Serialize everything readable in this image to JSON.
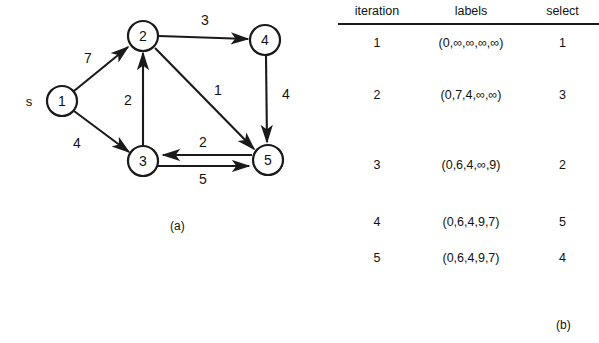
{
  "figure_a": {
    "caption": "(a)",
    "source_tag": "s",
    "nodes": [
      {
        "id": "1",
        "label": "1",
        "cx": 62,
        "cy": 101
      },
      {
        "id": "2",
        "label": "2",
        "cx": 143,
        "cy": 36
      },
      {
        "id": "3",
        "label": "3",
        "cx": 143,
        "cy": 161
      },
      {
        "id": "4",
        "label": "4",
        "cx": 265,
        "cy": 40
      },
      {
        "id": "5",
        "label": "5",
        "cx": 268,
        "cy": 160
      }
    ],
    "edges": [
      {
        "from": "1",
        "to": "2",
        "weight": "7",
        "lx": 88,
        "ly": 58
      },
      {
        "from": "1",
        "to": "3",
        "weight": "4",
        "lx": 77,
        "ly": 143
      },
      {
        "from": "3",
        "to": "2",
        "weight": "2",
        "lx": 128,
        "ly": 100
      },
      {
        "from": "2",
        "to": "4",
        "weight": "3",
        "lx": 205,
        "ly": 20
      },
      {
        "from": "2",
        "to": "5",
        "weight": "1",
        "lx": 218,
        "ly": 90
      },
      {
        "from": "4",
        "to": "5",
        "weight": "4",
        "lx": 286,
        "ly": 94
      },
      {
        "from": "5",
        "to": "3",
        "weight": "2",
        "lx": 203,
        "ly": 142
      },
      {
        "from": "3",
        "to": "5",
        "weight": "5",
        "lx": 203,
        "ly": 179
      }
    ]
  },
  "figure_b": {
    "caption": "(b)",
    "columns": [
      "iteration",
      "labels",
      "select"
    ],
    "rows": [
      {
        "iteration": "1",
        "labels": "(0,∞,∞,∞,∞)",
        "select": "1"
      },
      {
        "iteration": "2",
        "labels": "(0,7,4,∞,∞)",
        "select": "3"
      },
      {
        "iteration": "3",
        "labels": "(0,6,4,∞,9)",
        "select": "2"
      },
      {
        "iteration": "4",
        "labels": "(0,6,4,9,7)",
        "select": "5"
      },
      {
        "iteration": "5",
        "labels": "(0,6,4,9,7)",
        "select": "4"
      }
    ],
    "row_offsets": [
      55,
      92,
      162,
      232,
      275
    ]
  },
  "colors": {
    "ink": "#1a1a1a",
    "paper": "#ffffff"
  }
}
